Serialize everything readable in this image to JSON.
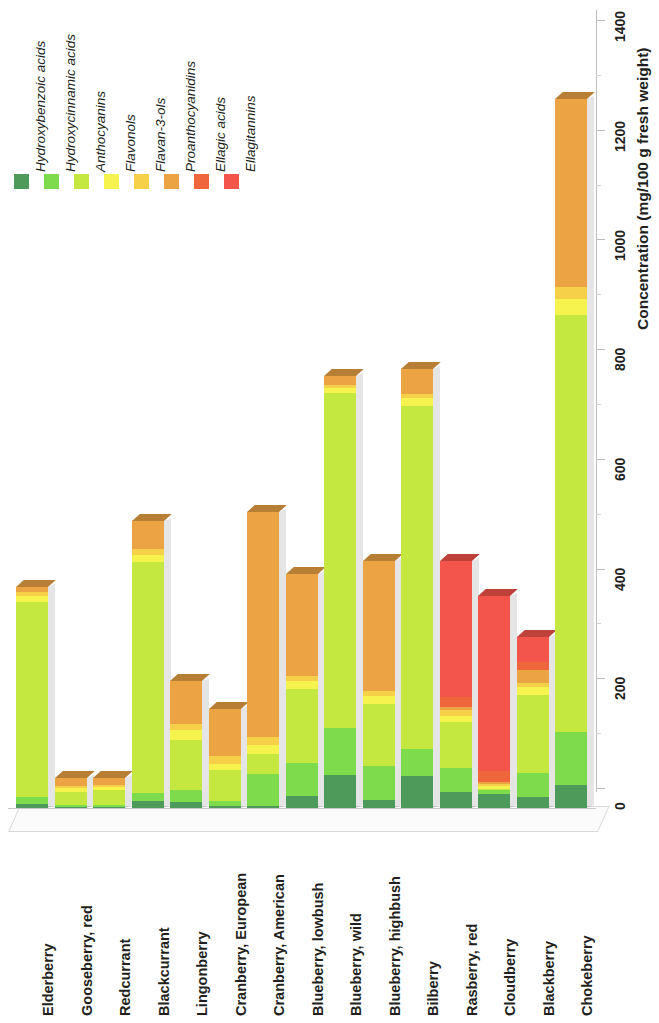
{
  "chart_data": {
    "type": "bar",
    "stacked": true,
    "title": "",
    "xlabel": "",
    "ylabel": "Concentration (mg/100 g fresh weight)",
    "ylim": [
      0,
      1400
    ],
    "yticks": [
      0,
      200,
      400,
      600,
      800,
      1000,
      1200,
      1400
    ],
    "grid": false,
    "legend_position": "top-left",
    "orientation": "vertical-rotated",
    "categories": [
      "Elderberry",
      "Gooseberry, red",
      "Redcurrant",
      "Blackcurrant",
      "Lingonberry",
      "Cranberry, European",
      "Cranberry, American",
      "Blueberry, lowbush",
      "Blueberry, wild",
      "Blueberry, highbush",
      "Bilberry",
      "Rasberry, red",
      "Cloudberry",
      "Blackberry",
      "Chokeberry"
    ],
    "series": [
      {
        "name": "Hydroxybenzoic acids",
        "color": "#4e9a5a",
        "values": [
          8,
          2,
          2,
          12,
          10,
          3,
          4,
          22,
          60,
          14,
          58,
          30,
          26,
          20,
          42
        ]
      },
      {
        "name": "Hydroxycinnamic acids",
        "color": "#7ddb4c",
        "values": [
          12,
          4,
          4,
          16,
          22,
          10,
          58,
          60,
          86,
          62,
          50,
          42,
          6,
          44,
          96
        ]
      },
      {
        "name": "Anthocyanins",
        "color": "#c4e840",
        "values": [
          355,
          24,
          26,
          420,
          92,
          56,
          36,
          134,
          610,
          114,
          625,
          84,
          2,
          142,
          760
        ]
      },
      {
        "name": "Flavonols",
        "color": "#f6f24e",
        "values": [
          12,
          6,
          6,
          14,
          18,
          12,
          16,
          16,
          10,
          14,
          14,
          12,
          6,
          14,
          30
        ]
      },
      {
        "name": "Flavan-3-ols",
        "color": "#f7d04a",
        "values": [
          6,
          4,
          4,
          10,
          12,
          14,
          16,
          8,
          6,
          10,
          8,
          10,
          4,
          8,
          22
        ]
      },
      {
        "name": "Proanthocyanidins",
        "color": "#eba344",
        "values": [
          10,
          14,
          12,
          52,
          78,
          86,
          410,
          186,
          16,
          236,
          46,
          6,
          4,
          24,
          342
        ]
      },
      {
        "name": "Ellagic acids",
        "color": "#f0663c",
        "values": [
          0,
          0,
          0,
          0,
          0,
          0,
          0,
          0,
          0,
          0,
          0,
          18,
          20,
          14,
          0
        ]
      },
      {
        "name": "Ellagitannins",
        "color": "#f4554a",
        "values": [
          0,
          0,
          0,
          0,
          0,
          0,
          0,
          0,
          0,
          0,
          0,
          248,
          318,
          46,
          0
        ]
      }
    ],
    "totals": [
      403,
      54,
      54,
      524,
      232,
      181,
      540,
      426,
      788,
      450,
      801,
      450,
      386,
      312,
      1292
    ]
  },
  "legend": {
    "items": [
      {
        "label": "Hydroxybenzoic acids",
        "color": "#4e9a5a"
      },
      {
        "label": "Hydroxycinnamic acids",
        "color": "#7ddb4c"
      },
      {
        "label": "Anthocyanins",
        "color": "#c4e840"
      },
      {
        "label": "Flavonols",
        "color": "#f6f24e"
      },
      {
        "label": "Flavan-3-ols",
        "color": "#f7d04a"
      },
      {
        "label": "Proanthocyanidins",
        "color": "#eba344"
      },
      {
        "label": "Ellagic acids",
        "color": "#f0663c"
      },
      {
        "label": "Ellagitannins",
        "color": "#f4554a"
      }
    ]
  },
  "axis": {
    "y_title": "Concentration (mg/100 g fresh weight)",
    "tick_labels": [
      "0",
      "200",
      "400",
      "600",
      "800",
      "1000",
      "1200",
      "1400"
    ]
  }
}
